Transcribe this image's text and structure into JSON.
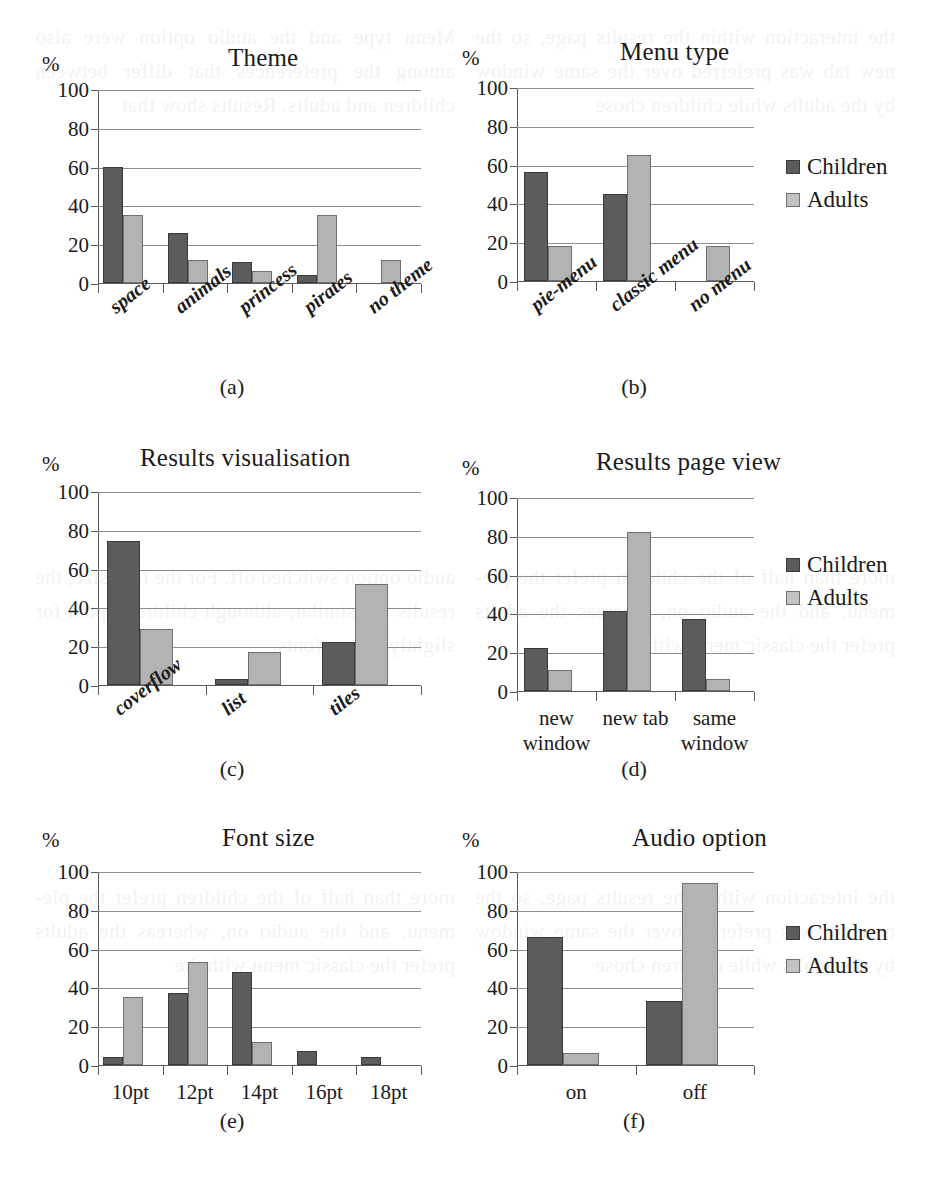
{
  "legend": {
    "children_label": "Children",
    "adults_label": "Adults",
    "children_color": "#5c5c5c",
    "adults_color": "#b3b3b3"
  },
  "axis": {
    "percent_symbol": "%",
    "yticks": [
      "0",
      "20",
      "40",
      "60",
      "80",
      "100"
    ]
  },
  "chart_data": [
    {
      "id": "a",
      "type": "bar",
      "title": "Theme",
      "caption": "(a)",
      "ylabel": "%",
      "xlabel": "",
      "ylim": [
        0,
        100
      ],
      "yticks": [
        0,
        20,
        40,
        60,
        80,
        100
      ],
      "grid": true,
      "legend": "none",
      "label_rotation": -38,
      "categories": [
        "space",
        "animals",
        "princess",
        "pirates",
        "no theme"
      ],
      "series": [
        {
          "name": "Children",
          "values": [
            60,
            26,
            11,
            4,
            0
          ]
        },
        {
          "name": "Adults",
          "values": [
            35,
            12,
            6,
            35,
            12
          ]
        }
      ]
    },
    {
      "id": "b",
      "type": "bar",
      "title": "Menu type",
      "caption": "(b)",
      "ylabel": "%",
      "xlabel": "",
      "ylim": [
        0,
        100
      ],
      "yticks": [
        0,
        20,
        40,
        60,
        80,
        100
      ],
      "grid": true,
      "legend": "right",
      "label_rotation": -38,
      "categories": [
        "pie-menu",
        "classic menu",
        "no menu"
      ],
      "series": [
        {
          "name": "Children",
          "values": [
            56,
            45,
            0
          ]
        },
        {
          "name": "Adults",
          "values": [
            18,
            65,
            18
          ]
        }
      ]
    },
    {
      "id": "c",
      "type": "bar",
      "title": "Results visualisation",
      "caption": "(c)",
      "ylabel": "%",
      "xlabel": "",
      "ylim": [
        0,
        100
      ],
      "yticks": [
        0,
        20,
        40,
        60,
        80,
        100
      ],
      "grid": true,
      "legend": "none",
      "label_rotation": -38,
      "categories": [
        "coverflow",
        "list",
        "tiles"
      ],
      "series": [
        {
          "name": "Children",
          "values": [
            74,
            3,
            22
          ]
        },
        {
          "name": "Adults",
          "values": [
            29,
            17,
            52
          ]
        }
      ]
    },
    {
      "id": "d",
      "type": "bar",
      "title": "Results page view",
      "caption": "(d)",
      "ylabel": "%",
      "xlabel": "",
      "ylim": [
        0,
        100
      ],
      "yticks": [
        0,
        20,
        40,
        60,
        80,
        100
      ],
      "grid": true,
      "legend": "right",
      "label_rotation": 0,
      "categories": [
        "new window",
        "new tab",
        "same window"
      ],
      "series": [
        {
          "name": "Children",
          "values": [
            22,
            41,
            37
          ]
        },
        {
          "name": "Adults",
          "values": [
            11,
            82,
            6
          ]
        }
      ]
    },
    {
      "id": "e",
      "type": "bar",
      "title": "Font size",
      "caption": "(e)",
      "ylabel": "%",
      "xlabel": "",
      "ylim": [
        0,
        100
      ],
      "yticks": [
        0,
        20,
        40,
        60,
        80,
        100
      ],
      "grid": true,
      "legend": "none",
      "label_rotation": 0,
      "categories": [
        "10pt",
        "12pt",
        "14pt",
        "16pt",
        "18pt"
      ],
      "series": [
        {
          "name": "Children",
          "values": [
            4,
            37,
            48,
            7,
            4
          ]
        },
        {
          "name": "Adults",
          "values": [
            35,
            53,
            12,
            0,
            0
          ]
        }
      ]
    },
    {
      "id": "f",
      "type": "bar",
      "title": "Audio option",
      "caption": "(f)",
      "ylabel": "%",
      "xlabel": "",
      "ylim": [
        0,
        100
      ],
      "yticks": [
        0,
        20,
        40,
        60,
        80,
        100
      ],
      "grid": true,
      "legend": "right",
      "label_rotation": 0,
      "categories": [
        "on",
        "off"
      ],
      "series": [
        {
          "name": "Children",
          "values": [
            66,
            33
          ]
        },
        {
          "name": "Adults",
          "values": [
            6,
            94
          ]
        }
      ]
    }
  ],
  "bleedthrough": [
    "the interaction within the results page, so the new tab was preferred over the same window by the adults while children chose",
    "Menu type and the audio option were also among the preferences that differ between children and adults. Results show that",
    "more than half of the children prefer the pie-menu, and the audio on, whereas the adults prefer the classic menu with the",
    "audio option switched off. For the font size, the results are similar, although children opted for slightly bigger fonts."
  ]
}
